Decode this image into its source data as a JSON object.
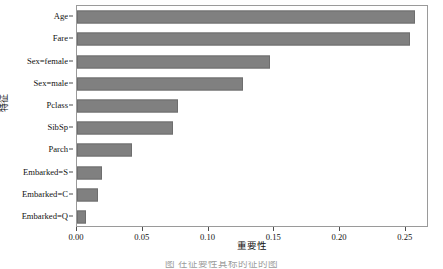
{
  "chart_data": {
    "type": "bar",
    "orientation": "horizontal",
    "title": "",
    "xlabel": "重要性",
    "ylabel": "特征",
    "categories": [
      "Age",
      "Fare",
      "Sex=female",
      "Sex=male",
      "Pclass",
      "SibSp",
      "Parch",
      "Embarked=S",
      "Embarked=C",
      "Embarked=Q"
    ],
    "values": [
      0.257,
      0.253,
      0.147,
      0.126,
      0.077,
      0.073,
      0.042,
      0.019,
      0.016,
      0.007
    ],
    "xlim": [
      0.0,
      0.2676
    ],
    "xticks": [
      0.0,
      0.05,
      0.1,
      0.15,
      0.2,
      0.25
    ],
    "xtick_labels": [
      "0.00",
      "0.05",
      "0.10",
      "0.15",
      "0.20",
      "0.25"
    ],
    "grid": false,
    "legend": false,
    "bar_color": "#808080",
    "bar_edge_color": "#6e6e6e",
    "axes_color": "#9a9a9a",
    "background": "#ffffff"
  },
  "caption": {
    "text": "图    在征要性其标的征的图"
  }
}
